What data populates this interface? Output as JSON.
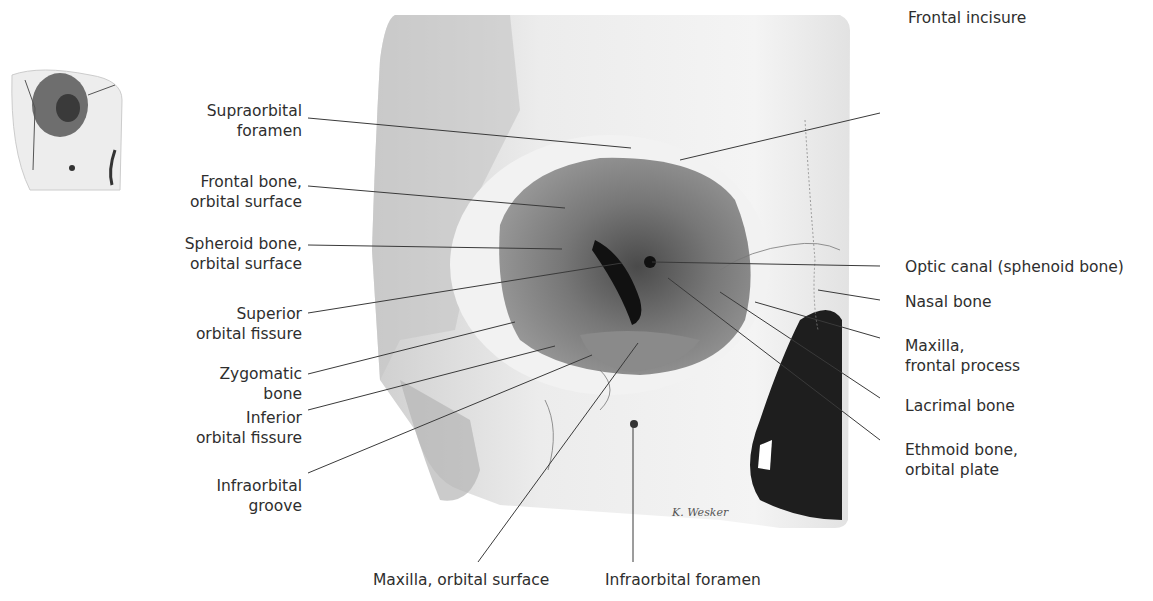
{
  "figure": {
    "thumbnail": {
      "description": "orientation thumbnail of skull orbit"
    },
    "signature": "K. Wesker",
    "colors": {
      "background": "#ffffff",
      "bone_light": "#e9e9e9",
      "bone_mid": "#bdbdbd",
      "orbit_dark": "#6e6e6e",
      "cavity_black": "#1e1e1e",
      "leader_line": "#3a3a3a",
      "text": "#2e2e2e"
    }
  },
  "labels": {
    "left": [
      {
        "id": "supraorbital-foramen",
        "lines": [
          "Supraorbital",
          "foramen"
        ]
      },
      {
        "id": "frontal-bone-orbital-surface",
        "lines": [
          "Frontal bone,",
          "orbital surface"
        ]
      },
      {
        "id": "sphenoid-bone-orbital-surface",
        "lines": [
          "Spheroid bone,",
          "orbital surface"
        ]
      },
      {
        "id": "superior-orbital-fissure",
        "lines": [
          "Superior",
          "orbital fissure"
        ]
      },
      {
        "id": "zygomatic-bone",
        "lines": [
          "Zygomatic",
          "bone"
        ]
      },
      {
        "id": "inferior-orbital-fissure",
        "lines": [
          "Inferior",
          "orbital fissure"
        ]
      },
      {
        "id": "infraorbital-groove",
        "lines": [
          "Infraorbital",
          "groove"
        ]
      }
    ],
    "right": [
      {
        "id": "frontal-incisure",
        "lines": [
          "Frontal incisure"
        ]
      },
      {
        "id": "optic-canal",
        "lines": [
          "Optic canal (sphenoid bone)"
        ]
      },
      {
        "id": "nasal-bone",
        "lines": [
          "Nasal bone"
        ]
      },
      {
        "id": "maxilla-frontal-process",
        "lines": [
          "Maxilla,",
          "frontal process"
        ]
      },
      {
        "id": "lacrimal-bone",
        "lines": [
          "Lacrimal bone"
        ]
      },
      {
        "id": "ethmoid-bone-orbital-plate",
        "lines": [
          "Ethmoid bone,",
          "orbital plate"
        ]
      }
    ],
    "bottom": [
      {
        "id": "maxilla-orbital-surface",
        "lines": [
          "Maxilla, orbital surface"
        ]
      },
      {
        "id": "infraorbital-foramen",
        "lines": [
          "Infraorbital foramen"
        ]
      }
    ]
  }
}
